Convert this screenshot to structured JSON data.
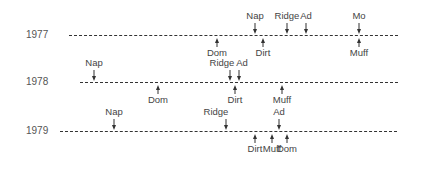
{
  "diagram": {
    "title": "",
    "line_color": "#333333",
    "text_color": "#444444",
    "rows": [
      {
        "year": "1977",
        "y": 35,
        "x_start": 69,
        "x_end": 398,
        "label_x": 26,
        "above": [
          {
            "label": "Nap",
            "x": 255
          },
          {
            "label": "Ridge",
            "x": 287
          },
          {
            "label": "Ad",
            "x": 306
          },
          {
            "label": "Mo",
            "x": 359
          }
        ],
        "below": [
          {
            "label": "Dom",
            "x": 217
          },
          {
            "label": "Dirt",
            "x": 263
          },
          {
            "label": "Muff",
            "x": 359
          }
        ]
      },
      {
        "year": "1978",
        "y": 82,
        "x_start": 80,
        "x_end": 398,
        "label_x": 26,
        "above": [
          {
            "label": "Nap",
            "x": 94
          },
          {
            "label": "Ridge",
            "x": 230,
            "label_dx": -8
          },
          {
            "label": "Ad",
            "x": 239,
            "label_dx": 3
          }
        ],
        "below": [
          {
            "label": "Dom",
            "x": 158
          },
          {
            "label": "Dirt",
            "x": 235
          },
          {
            "label": "Muff",
            "x": 282
          }
        ]
      },
      {
        "year": "1979",
        "y": 131,
        "x_start": 60,
        "x_end": 397,
        "label_x": 26,
        "above": [
          {
            "label": "Nap",
            "x": 114
          },
          {
            "label": "Ridge",
            "x": 226,
            "label_dx": -10
          },
          {
            "label": "Ad",
            "x": 279
          }
        ],
        "below": [
          {
            "label": "Dirt",
            "x": 255
          },
          {
            "label": "Muff",
            "x": 272
          },
          {
            "label": "Dom",
            "x": 287
          }
        ]
      }
    ]
  }
}
